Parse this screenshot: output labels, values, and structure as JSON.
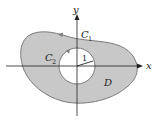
{
  "diagram": {
    "type": "region-with-hole",
    "axes": {
      "x_label": "x",
      "y_label": "y"
    },
    "outer_curve": {
      "label": "C",
      "subscript": "1",
      "orientation": "counterclockwise"
    },
    "inner_curve": {
      "label": "C",
      "subscript": "2",
      "orientation": "clockwise",
      "radius_label": "1"
    },
    "region": {
      "label": "D"
    },
    "colors": {
      "region_fill": "#c8c8c8",
      "curve_stroke": "#7a7a7a",
      "axis_stroke": "#222222",
      "hole_fill": "#ffffff"
    }
  }
}
